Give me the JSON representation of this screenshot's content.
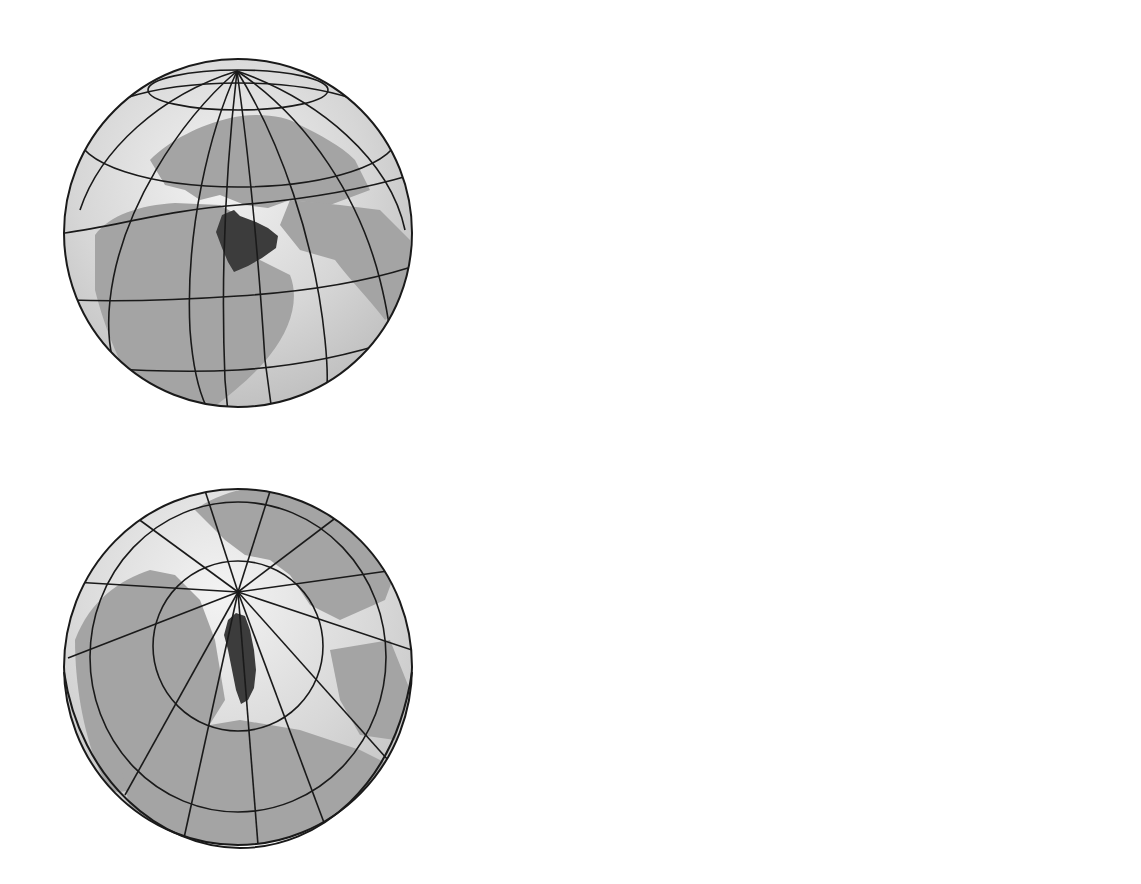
{
  "figure": {
    "highlighted_regions": [
      "Greenland",
      "Saudi Arabia"
    ],
    "colors": {
      "background": "#ffffff",
      "ocean": "#d9d9d9",
      "ocean_light": "#f0f0f0",
      "land": "#a4a4a4",
      "highlight": "#3c3c3c",
      "graticule": "#1a1a1a",
      "label_badge": "#111111",
      "label_text": "#ffffff"
    }
  },
  "panels": [
    {
      "id": "a",
      "label": "a",
      "title": "Orthographic globe views",
      "views": [
        {
          "name": "globe-centered-on-arabia",
          "highlight": "Saudi Arabia"
        },
        {
          "name": "globe-north-polar-view",
          "highlight": "Greenland"
        }
      ]
    },
    {
      "id": "b",
      "label": "b",
      "title": "Mollweide projection",
      "highlights": [
        "Greenland",
        "Saudi Arabia"
      ]
    },
    {
      "id": "c",
      "label": "c",
      "title": "Mercator projection",
      "highlights": [
        "Greenland",
        "Saudi Arabia"
      ],
      "grid": {
        "columns": 12,
        "rows": 6
      }
    }
  ]
}
